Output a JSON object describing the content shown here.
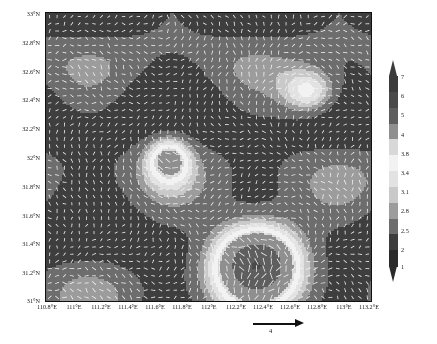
{
  "figure": {
    "type": "wind-vector-field-map",
    "background_color": "#ffffff"
  },
  "axes": {
    "x_tick_labels": [
      "110.8°E",
      "111°E",
      "111.2°E",
      "111.4°E",
      "111.6°E",
      "111.8°E",
      "112°E",
      "112.2°E",
      "112.4°E",
      "112.6°E",
      "112.8°E",
      "113°E",
      "113.2°E"
    ],
    "y_tick_labels": [
      "33°N",
      "32.8°N",
      "32.6°N",
      "32.4°N",
      "32.2°N",
      "32°N",
      "31.8°N",
      "31.6°N",
      "31.4°N",
      "31.2°N",
      "31°N"
    ]
  },
  "colorbar": {
    "tick_labels": [
      "7",
      "6",
      "5",
      "4",
      "3.8",
      "3.4",
      "3.1",
      "2.8",
      "2.5",
      "2",
      "1"
    ],
    "band_colors": [
      "#3c3c3c",
      "#4a4a4a",
      "#5e5e5e",
      "#8f8f8f",
      "#d8d8d8",
      "#f2f2f2",
      "#e2e2e2",
      "#c9c9c9",
      "#9c9c9c",
      "#6d6d6d",
      "#3e3e3e",
      "#2b2b2b"
    ],
    "extend_top": true,
    "extend_bottom": true
  },
  "reference_arrow": {
    "label": "4",
    "direction": "east"
  },
  "chart_data": {
    "type": "heatmap",
    "title": "",
    "xlabel": "",
    "ylabel": "",
    "xlim": [
      110.8,
      113.2
    ],
    "ylim": [
      31.0,
      33.0
    ],
    "xticks": [
      110.8,
      111.0,
      111.2,
      111.4,
      111.6,
      111.8,
      112.0,
      112.2,
      112.4,
      112.6,
      112.8,
      113.0,
      113.2
    ],
    "yticks": [
      33.0,
      32.8,
      32.6,
      32.4,
      32.2,
      32.0,
      31.8,
      31.6,
      31.4,
      31.2,
      31.0
    ],
    "grid": false,
    "legend_position": "right",
    "colorbar_levels": [
      1,
      2,
      2.5,
      2.8,
      3.1,
      3.4,
      3.8,
      4,
      5,
      6,
      7
    ],
    "colormap": "grayscale",
    "overlay": "wind-vectors",
    "vector_reference_magnitude": 4,
    "shading_field_note": "Shaded magnitude field, darker = lower values near 1-3, bright patch lower-centre near 112.1-112.6E / 31.1-31.5N reaching 4-7",
    "bright_regions": [
      {
        "x_range": [
          112.05,
          112.65
        ],
        "y_range": [
          31.05,
          31.55
        ],
        "value": 6.0
      },
      {
        "x_range": [
          111.55,
          111.85
        ],
        "y_range": [
          31.85,
          32.15
        ],
        "value": 4.2
      },
      {
        "x_range": [
          112.55,
          112.95
        ],
        "y_range": [
          32.3,
          32.6
        ],
        "value": 3.9
      }
    ]
  }
}
